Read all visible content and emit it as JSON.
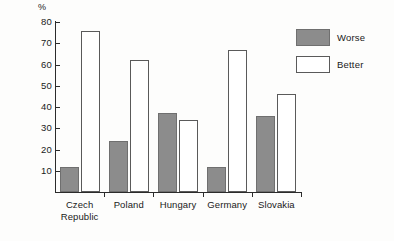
{
  "chart_data": {
    "type": "bar",
    "title": "",
    "xlabel": "",
    "ylabel": "%",
    "ylim": [
      0,
      80
    ],
    "yticks": [
      10,
      20,
      30,
      40,
      50,
      60,
      70,
      80
    ],
    "ytick_labels": [
      "10",
      "20",
      "30",
      "40",
      "50",
      "60",
      "70",
      "80"
    ],
    "grid": false,
    "legend_position": "right-top",
    "categories": [
      "Czech Republic",
      "Poland",
      "Hungary",
      "Germany",
      "Slovakia"
    ],
    "category_lines": [
      [
        "Czech",
        "Republic"
      ],
      [
        "Poland"
      ],
      [
        "Hungary"
      ],
      [
        "Germany"
      ],
      [
        "Slovakia"
      ]
    ],
    "series": [
      {
        "name": "Worse",
        "color": "#8c8c8c",
        "values": [
          12,
          24,
          37,
          12,
          36
        ]
      },
      {
        "name": "Better",
        "color": "#ffffff",
        "values": [
          76,
          62,
          34,
          67,
          46
        ]
      }
    ]
  },
  "legend": {
    "items": [
      {
        "label": "Worse",
        "swatch": "worse"
      },
      {
        "label": "Better",
        "swatch": "better"
      }
    ]
  },
  "axis": {
    "unit_label": "%"
  }
}
